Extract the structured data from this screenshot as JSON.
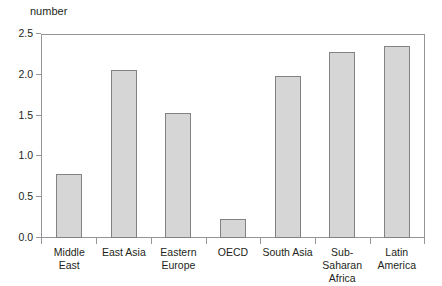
{
  "chart_data": {
    "type": "bar",
    "title": "",
    "subtitle": "",
    "xlabel": "",
    "ylabel": "number",
    "ylim": [
      0,
      2.5
    ],
    "grid": false,
    "legend": null,
    "legend_position": "none",
    "yticks": [
      "0.0",
      "0.5",
      "1.0",
      "1.5",
      "2.0",
      "2.5"
    ],
    "ytick_values": [
      0.0,
      0.5,
      1.0,
      1.5,
      2.0,
      2.5
    ],
    "categories": [
      "Middle East",
      "East Asia",
      "Eastern Europe",
      "OECD",
      "South Asia",
      "Sub-Saharan Africa",
      "Latin America"
    ],
    "values": [
      0.79,
      2.07,
      1.54,
      0.23,
      2.0,
      2.29,
      2.36
    ],
    "bar_fill_color": "#d6d6d6",
    "bar_border_color": "#808285",
    "axis_color": "#939598",
    "text_color": "#231f20"
  },
  "axis": {
    "y_unit_label": "number"
  }
}
